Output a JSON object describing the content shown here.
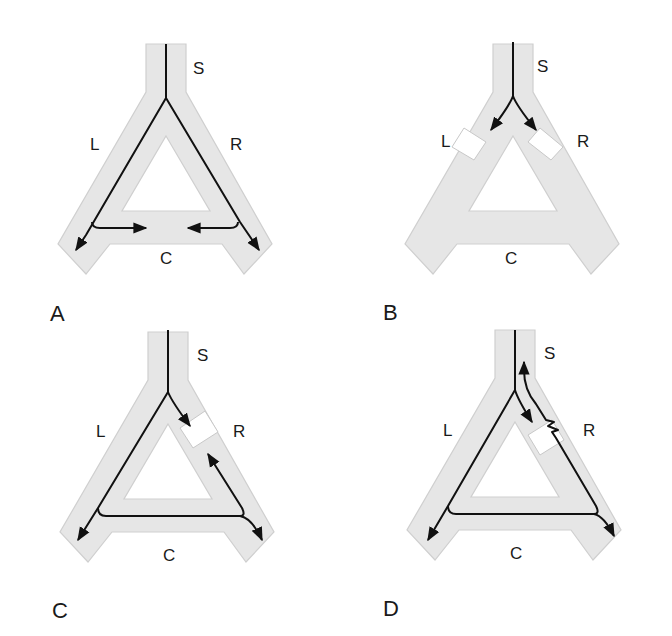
{
  "figure": {
    "colors": {
      "tube_fill": "#e6e6e6",
      "tube_edge": "#cfcfcf",
      "block_fill": "#ffffff",
      "block_edge": "#c8c8c8",
      "flow_line": "#111111",
      "label": "#1a1a1a"
    },
    "tube_labels": {
      "stem": "S",
      "left": "L",
      "right": "R",
      "cross": "C"
    },
    "panels": [
      {
        "id": "A",
        "letter": "A",
        "offset": [
          0,
          0
        ],
        "description": "Flow from S divides into L and R; each sends a branch along C toward the middle (opposing arrows).",
        "blocks": [],
        "flows": [
          {
            "d": "M166 44 L166 98 L86 235 L76 250",
            "arrow": "end"
          },
          {
            "d": "M166 98 L240 222 L259 250",
            "arrow": "end"
          },
          {
            "d": "M92 222 Q92 228 100 228 L146 228",
            "arrow": "end"
          },
          {
            "d": "M238 222 Q238 228 230 228 L188 228",
            "arrow": "end"
          }
        ],
        "labels": [
          {
            "key": "stem",
            "x": 193,
            "y": 60
          },
          {
            "key": "left",
            "x": 90,
            "y": 136
          },
          {
            "key": "right",
            "x": 230,
            "y": 136
          },
          {
            "key": "cross",
            "x": 160,
            "y": 250
          }
        ],
        "letter_pos": [
          50,
          303
        ]
      },
      {
        "id": "B",
        "letter": "B",
        "offset": [
          336,
          0
        ],
        "description": "Both L and R branches are blocked just below the bifurcation; flow from S stops at the blocks.",
        "blocks": [
          {
            "pts": "464,128 486,142 474,160 452,147"
          },
          {
            "pts": "540,128 563,147 551,160 528,142"
          }
        ],
        "flows": [
          {
            "d": "M177 42 L177 96 Q174 105 155 130",
            "arrow": "end"
          },
          {
            "d": "M177 96 Q180 105 200 130",
            "arrow": "end"
          }
        ],
        "labels": [
          {
            "key": "stem",
            "x": 201,
            "y": 58
          },
          {
            "key": "left",
            "x": 105,
            "y": 133
          },
          {
            "key": "right",
            "x": 241,
            "y": 133
          },
          {
            "key": "cross",
            "x": 169,
            "y": 250
          }
        ],
        "letter_pos": [
          47,
          302
        ]
      },
      {
        "id": "C",
        "letter": "C",
        "offset": [
          0,
          318
        ],
        "description": "R is blocked; flow goes down L, across C, then splits: retrograde up R to the block and onward down the right leg.",
        "blocks": [
          {
            "pts": "180,428 205,411 218,432 193,448"
          }
        ],
        "flows": [
          {
            "d": "M168 12 L168 74 Q172 84 190 108",
            "arrow": "end"
          },
          {
            "d": "M168 74 L98 190 L78 222",
            "arrow": "end"
          },
          {
            "d": "M98 190 Q98 198 106 198 L240 198 Q252 200 262 222",
            "arrow": "end"
          },
          {
            "d": "M240 198 Q246 198 242 190 L208 136",
            "arrow": "end"
          }
        ],
        "labels": [
          {
            "key": "stem",
            "x": 197,
            "y": 29
          },
          {
            "key": "left",
            "x": 96,
            "y": 105
          },
          {
            "key": "right",
            "x": 233,
            "y": 105
          },
          {
            "key": "cross",
            "x": 163,
            "y": 229
          }
        ],
        "letter_pos": [
          52,
          282
        ]
      },
      {
        "id": "D",
        "letter": "D",
        "offset": [
          336,
          318
        ],
        "description": "R partially obstructed (zigzag through block); flow goes down L, across C, retrograde up R through the obstruction back to S, and down the right leg.",
        "blocks": [
          {
            "pts": "528,435 552,420 564,440 540,455"
          }
        ],
        "flows": [
          {
            "d": "M179 12 L179 72 Q182 82 196 104",
            "arrow": "end"
          },
          {
            "d": "M179 72 L112 188 L92 222",
            "arrow": "end"
          },
          {
            "d": "M112 188 Q112 196 120 196 L258 196 Q268 198 278 218",
            "arrow": "end"
          },
          {
            "d": "M258 196 Q264 196 260 188 L220 120 L216 114 L222 112 L212 108 L218 104 L210 102 L200 86 Q188 72 188 52 L188 44",
            "arrow": "end"
          }
        ],
        "labels": [
          {
            "key": "stem",
            "x": 208,
            "y": 27
          },
          {
            "key": "left",
            "x": 107,
            "y": 104
          },
          {
            "key": "right",
            "x": 247,
            "y": 104
          },
          {
            "key": "cross",
            "x": 174,
            "y": 227
          }
        ],
        "letter_pos": [
          47,
          280
        ]
      }
    ]
  }
}
